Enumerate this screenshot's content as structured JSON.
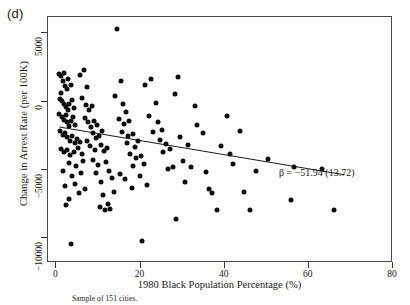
{
  "figure": {
    "panel_label": "(d)",
    "caption": "Sample of 151 cities.",
    "annotation": "β = −51.94 (13.72)"
  },
  "chart_data": {
    "type": "scatter",
    "title": "",
    "panel": "(d)",
    "xlabel": "1980 Black Population Percentage (%)",
    "ylabel": "Change in Arrest Rate (per 100K)",
    "xlim": [
      -2,
      80
    ],
    "ylim": [
      -11800,
      6200
    ],
    "xticks": [
      0,
      20,
      40,
      60,
      80
    ],
    "xticklabels": [
      "0",
      "20",
      "40",
      "60",
      "80"
    ],
    "yticks": [
      5000,
      0,
      -5000,
      -10000
    ],
    "yticklabels": [
      "5000",
      "0",
      "−5000",
      "−10000"
    ],
    "grid": false,
    "legend": null,
    "n_points": 151,
    "annotations": [
      {
        "text": "β = −51.94 (13.72)",
        "x": 44.5,
        "y": -6100,
        "beta": -51.94,
        "std_error": 13.72
      }
    ],
    "fit_line": {
      "type": "linear",
      "slope": -51.94,
      "intercept": -1800,
      "x_start": 0.7,
      "x_end": 68.5,
      "y_start": -1850,
      "y_end": -5350
    },
    "points": [
      [
        0.6,
        2020
      ],
      [
        1.2,
        1880
      ],
      [
        1.5,
        1500
      ],
      [
        1.8,
        2080
      ],
      [
        2.1,
        1150
      ],
      [
        2.4,
        900
      ],
      [
        1.0,
        650
      ],
      [
        2.8,
        1700
      ],
      [
        3.4,
        1250
      ],
      [
        0.9,
        200
      ],
      [
        1.4,
        60
      ],
      [
        1.9,
        -150
      ],
      [
        2.3,
        -380
      ],
      [
        2.7,
        -620
      ],
      [
        3.1,
        -200
      ],
      [
        3.6,
        100
      ],
      [
        4.1,
        -430
      ],
      [
        0.7,
        -900
      ],
      [
        1.3,
        -1100
      ],
      [
        1.7,
        -1320
      ],
      [
        2.2,
        -980
      ],
      [
        2.6,
        -1500
      ],
      [
        3.0,
        -1750
      ],
      [
        3.5,
        -1420
      ],
      [
        4.0,
        -1150
      ],
      [
        4.5,
        -1680
      ],
      [
        0.8,
        -2150
      ],
      [
        1.5,
        -2400
      ],
      [
        2.0,
        -2280
      ],
      [
        2.5,
        -2600
      ],
      [
        3.2,
        -2880
      ],
      [
        3.8,
        -2500
      ],
      [
        4.3,
        -3050
      ],
      [
        5.0,
        -2750
      ],
      [
        5.5,
        -2950
      ],
      [
        1.1,
        -3450
      ],
      [
        1.8,
        -3700
      ],
      [
        2.4,
        -3520
      ],
      [
        3.3,
        -3900
      ],
      [
        4.2,
        -3650
      ],
      [
        5.2,
        -3380
      ],
      [
        6.0,
        -3820
      ],
      [
        2.9,
        -4450
      ],
      [
        4.7,
        -4700
      ],
      [
        6.3,
        -4300
      ],
      [
        1.6,
        -5100
      ],
      [
        3.7,
        -5450
      ],
      [
        5.8,
        -5200
      ],
      [
        2.0,
        -6200
      ],
      [
        4.4,
        -6050
      ],
      [
        3.0,
        -7100
      ],
      [
        5.4,
        -6700
      ],
      [
        2.2,
        -7550
      ],
      [
        6.8,
        -6400
      ],
      [
        3.5,
        -10400
      ],
      [
        5.6,
        1950
      ],
      [
        6.5,
        2350
      ],
      [
        7.2,
        1050
      ],
      [
        6.1,
        300
      ],
      [
        7.0,
        -250
      ],
      [
        7.8,
        -620
      ],
      [
        8.5,
        -330
      ],
      [
        6.7,
        -1180
      ],
      [
        7.5,
        -1500
      ],
      [
        8.2,
        -1850
      ],
      [
        9.0,
        -1420
      ],
      [
        9.7,
        -1700
      ],
      [
        8.8,
        -2300
      ],
      [
        9.4,
        -2650
      ],
      [
        10.2,
        -2480
      ],
      [
        10.9,
        -2150
      ],
      [
        7.3,
        -2900
      ],
      [
        8.0,
        -3250
      ],
      [
        9.1,
        -3500
      ],
      [
        10.5,
        -3150
      ],
      [
        11.3,
        -3600
      ],
      [
        12.0,
        -3350
      ],
      [
        8.6,
        -4250
      ],
      [
        10.0,
        -4600
      ],
      [
        11.7,
        -4400
      ],
      [
        9.5,
        -5200
      ],
      [
        12.5,
        -5050
      ],
      [
        10.7,
        -5900
      ],
      [
        13.1,
        -5600
      ],
      [
        11.1,
        -6850
      ],
      [
        13.8,
        -6600
      ],
      [
        10.3,
        -7700
      ],
      [
        12.2,
        -7450
      ],
      [
        11.5,
        -7900
      ],
      [
        12.8,
        -7850
      ],
      [
        14.5,
        5350
      ],
      [
        15.3,
        1550
      ],
      [
        14.0,
        400
      ],
      [
        15.8,
        -200
      ],
      [
        16.5,
        -780
      ],
      [
        14.8,
        -1250
      ],
      [
        16.0,
        -1600
      ],
      [
        17.2,
        -1400
      ],
      [
        15.5,
        -2200
      ],
      [
        17.0,
        -2500
      ],
      [
        18.1,
        -2350
      ],
      [
        16.8,
        -3050
      ],
      [
        18.6,
        -3300
      ],
      [
        19.4,
        -2900
      ],
      [
        17.6,
        -3800
      ],
      [
        19.0,
        -4100
      ],
      [
        20.1,
        -3950
      ],
      [
        18.3,
        -4700
      ],
      [
        20.8,
        -4550
      ],
      [
        15.0,
        -5300
      ],
      [
        16.3,
        -5650
      ],
      [
        19.8,
        -5450
      ],
      [
        17.9,
        -6300
      ],
      [
        21.5,
        -6100
      ],
      [
        20.3,
        -10200
      ],
      [
        22.4,
        1700
      ],
      [
        23.6,
        -120
      ],
      [
        22.0,
        -1050
      ],
      [
        24.2,
        -1450
      ],
      [
        23.0,
        -2250
      ],
      [
        25.0,
        -2050
      ],
      [
        24.6,
        -2800
      ],
      [
        26.1,
        -3100
      ],
      [
        25.4,
        -3700
      ],
      [
        27.0,
        -3450
      ],
      [
        26.5,
        -4900
      ],
      [
        27.8,
        -4750
      ],
      [
        28.5,
        -8550
      ],
      [
        29.3,
        -2550
      ],
      [
        30.0,
        -4350
      ],
      [
        31.2,
        -3200
      ],
      [
        32.0,
        -4800
      ],
      [
        30.6,
        -5900
      ],
      [
        33.5,
        -1700
      ],
      [
        34.8,
        -2300
      ],
      [
        35.5,
        -5150
      ],
      [
        36.3,
        -6400
      ],
      [
        37.0,
        -6650
      ],
      [
        38.2,
        -7950
      ],
      [
        39.0,
        -3250
      ],
      [
        40.5,
        -1050
      ],
      [
        41.3,
        -3850
      ],
      [
        42.0,
        -4550
      ],
      [
        43.6,
        -2150
      ],
      [
        44.5,
        -6600
      ],
      [
        46.0,
        -7900
      ],
      [
        47.5,
        -5050
      ],
      [
        50.2,
        -4200
      ],
      [
        55.8,
        -7200
      ],
      [
        56.5,
        -4750
      ],
      [
        63.2,
        -4950
      ],
      [
        66.0,
        -7900
      ],
      [
        29.0,
        1800
      ],
      [
        21.0,
        1200
      ],
      [
        28.2,
        550
      ],
      [
        33.0,
        -300
      ]
    ]
  }
}
